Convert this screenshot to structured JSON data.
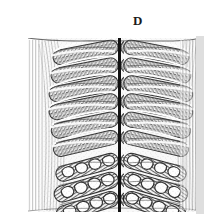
{
  "figure": {
    "panel_label": "D",
    "background_color": "#ffffff",
    "width": 204,
    "height": 222
  },
  "micrograph": {
    "modality": "light-micrograph",
    "rendering": "grayscale-stipple-engraving",
    "ink_color": "#1a1a1a",
    "mid_tone_color": "#6e6e6e",
    "light_tone_color": "#cfcfcf",
    "specimen_bounds": {
      "left": 28,
      "top": 38,
      "right": 196,
      "bottom": 212
    },
    "right_edge_band": {
      "left": 196,
      "width": 8,
      "color": "#d8d8d8"
    },
    "midline_septum": {
      "name": "midline-septum",
      "x": 119,
      "top": 38,
      "bottom": 212,
      "width": 3,
      "color": "#111111"
    },
    "symmetry": "bilateral-mirrored-about-midline",
    "zones": [
      {
        "name": "dark-lobe-zone",
        "description": "upper region of dense stippled elongated lobes angled up toward the midline",
        "top": 38,
        "bottom": 150,
        "lobe_count_per_side": 6,
        "lobe_fill": "#5a5a5a",
        "lobe_outline": "#1c1c1c",
        "interlobe_gap": "#f4f4f4"
      },
      {
        "name": "vesicular-cell-zone",
        "description": "lower region of diagonal rows containing outlined polygonal vesicles",
        "top": 150,
        "bottom": 212,
        "row_count_per_side": 3,
        "vesicles_per_row": 4,
        "vesicle_fill": "#ffffff",
        "vesicle_outline": "#141414"
      },
      {
        "name": "outer-cortex-striations",
        "description": "fine parallel curved striations along the outer left and right margins",
        "left_band": {
          "left": 28,
          "width": 22
        },
        "right_band": {
          "left": 174,
          "width": 22
        },
        "line_color": "#7a7a7a"
      }
    ],
    "lobe_rows_y": [
      44,
      62,
      80,
      98,
      116,
      134
    ],
    "vesicle_rows_y": [
      158,
      177,
      196
    ]
  }
}
